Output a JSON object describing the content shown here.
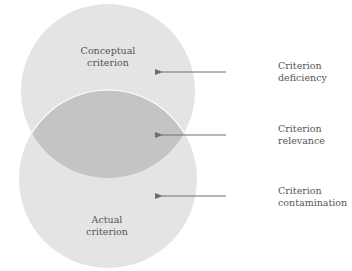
{
  "diagram": {
    "type": "venn",
    "colors": {
      "circle_fill": "#e4e4e4",
      "overlap_fill": "#c4c4c4",
      "seam": "#ffffff",
      "arrow": "#6e6e6e",
      "text": "#555555"
    },
    "circles": [
      {
        "id": "conceptual",
        "label_lines": [
          "Conceptual",
          "criterion"
        ]
      },
      {
        "id": "actual",
        "label_lines": [
          "Actual",
          "criterion"
        ]
      }
    ],
    "annotations": [
      {
        "id": "deficiency",
        "target": "conceptual-only region",
        "label_lines": [
          "Criterion",
          "deficiency"
        ]
      },
      {
        "id": "relevance",
        "target": "overlap region",
        "label_lines": [
          "Criterion",
          "relevance"
        ]
      },
      {
        "id": "contamination",
        "target": "actual-only region",
        "label_lines": [
          "Criterion",
          "contamination"
        ]
      }
    ]
  }
}
